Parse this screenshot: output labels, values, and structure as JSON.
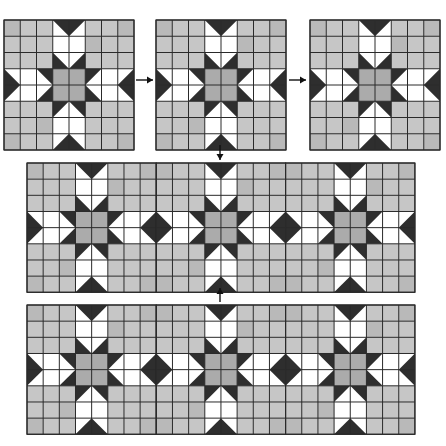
{
  "diagram": {
    "title": "",
    "grid_cells_per_block": 8,
    "colors": {
      "light_gray": "#c6c6c6",
      "light_gray_alt": "#b9b9b9",
      "center_gray": "#ababab",
      "dark": "#2e2e2e",
      "white": "#ffffff",
      "line": "#2a2a2a"
    },
    "single_blocks": [
      {
        "id": "block-1",
        "x": 4,
        "y": 20,
        "size": 130
      },
      {
        "id": "block-2",
        "x": 156,
        "y": 20,
        "size": 130
      },
      {
        "id": "block-3",
        "x": 310,
        "y": 20,
        "size": 130
      }
    ],
    "panels": [
      {
        "id": "panel-row-1",
        "x": 27,
        "y": 163,
        "blocks": 3,
        "block_size": 129.3
      },
      {
        "id": "panel-row-2",
        "x": 27,
        "y": 305,
        "blocks": 3,
        "block_size": 129.3
      }
    ],
    "arrows": [
      {
        "id": "arrow-block1-to-block2",
        "direction": "right",
        "x1": 136,
        "y1": 80,
        "x2": 153,
        "y2": 80
      },
      {
        "id": "arrow-block2-to-block3",
        "direction": "right",
        "x1": 289,
        "y1": 80,
        "x2": 306,
        "y2": 80
      },
      {
        "id": "arrow-block2-to-panel1",
        "direction": "down",
        "x1": 220,
        "y1": 145,
        "x2": 220,
        "y2": 160
      },
      {
        "id": "arrow-panel2-to-panel1",
        "direction": "up",
        "x1": 220,
        "y1": 302,
        "x2": 220,
        "y2": 288
      }
    ]
  }
}
